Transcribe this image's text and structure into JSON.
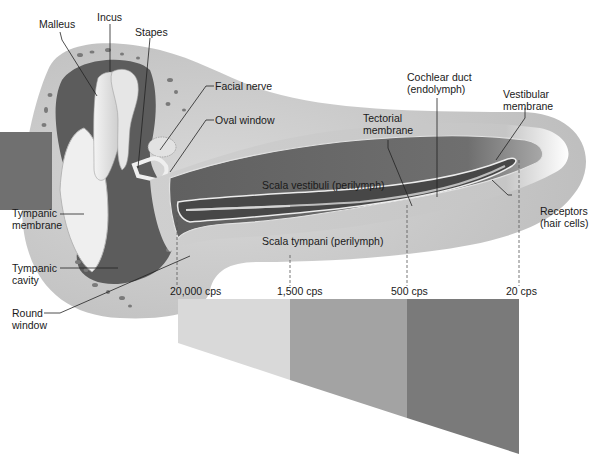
{
  "figure": {
    "type": "anatomical diagram"
  },
  "labels": {
    "malleus": "Malleus",
    "incus": "Incus",
    "stapes": "Stapes",
    "facial_nerve": "Facial nerve",
    "oval_window": "Oval window",
    "cochlear_duct_line1": "Cochlear duct",
    "cochlear_duct_line2": "(endolymph)",
    "vestibular_membrane_line1": "Vestibular",
    "vestibular_membrane_line2": "membrane",
    "tectorial_membrane_line1": "Tectorial",
    "tectorial_membrane_line2": "membrane",
    "tympanic_membrane_line1": "Tympanic",
    "tympanic_membrane_line2": "membrane",
    "tympanic_cavity_line1": "Tympanic",
    "tympanic_cavity_line2": "cavity",
    "round_window_line1": "Round",
    "round_window_line2": "window",
    "receptors_line1": "Receptors",
    "receptors_line2": "(hair cells)",
    "scala_vestibuli": "Scala vestibuli (perilymph)",
    "scala_tympani": "Scala tympani (perilymph)"
  },
  "frequency_markers": [
    {
      "label": "20,000 cps",
      "x": 177
    },
    {
      "label": "1,500 cps",
      "x": 290
    },
    {
      "label": "500 cps",
      "x": 407
    },
    {
      "label": "20 cps",
      "x": 519
    }
  ],
  "frequency_bands": [
    {
      "from": "20,000 cps",
      "to": "1,500 cps",
      "color": "#d9d9d9"
    },
    {
      "from": "1,500 cps",
      "to": "500 cps",
      "color": "#a3a3a3"
    },
    {
      "from": "500 cps",
      "to": "20 cps",
      "color": "#7a7a7a"
    }
  ],
  "colors": {
    "bone": "#c8c8c8",
    "cavity": "#5e5e5e",
    "cochlea_outer": "#c4c4c4",
    "scala": "#6a6a6a",
    "duct": "#4a4a4a",
    "membrane_line": "#e8e8e8"
  }
}
